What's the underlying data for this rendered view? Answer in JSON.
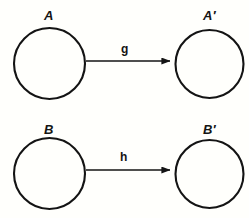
{
  "diagram": {
    "type": "mapping-diagram",
    "background_color": "#fffffc",
    "stroke_color": "#141414",
    "rows": [
      {
        "id": "row-g",
        "source": {
          "label": "A",
          "shape": "circle",
          "cx": 49.5,
          "cy": 63.5,
          "r": 35.5
        },
        "target": {
          "label": "A′",
          "shape": "circle",
          "cx": 209.5,
          "cy": 64,
          "r": 34
        },
        "arrow": {
          "label": "g",
          "x1": 86,
          "x2": 172,
          "y": 61
        }
      },
      {
        "id": "row-h",
        "source": {
          "label": "B",
          "shape": "circle",
          "cx": 49.5,
          "cy": 173.5,
          "r": 35.5
        },
        "target": {
          "label": "B′",
          "shape": "circle",
          "cx": 209.5,
          "cy": 174,
          "r": 34
        },
        "arrow": {
          "label": "h",
          "x1": 86,
          "x2": 172,
          "y": 170
        }
      }
    ]
  }
}
